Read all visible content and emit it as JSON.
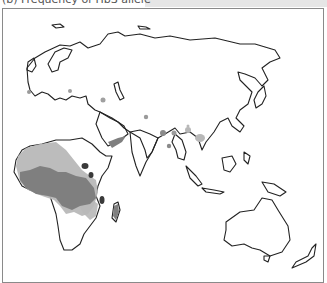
{
  "figure": {
    "title": "(b) Frequency of HbS allele"
  },
  "map": {
    "region": "Africa, Europe, Asia, Australia",
    "colors": {
      "outline": "#222222",
      "low_frequency": "#b8b8b8",
      "medium_frequency": "#7f7f7f",
      "high_frequency": "#3a3a3a",
      "background": "#ffffff",
      "header_strip": "#e6e6e6"
    }
  }
}
